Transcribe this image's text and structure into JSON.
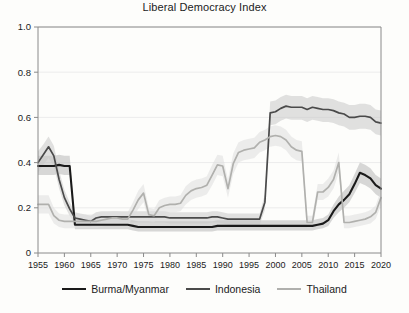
{
  "chart_data": {
    "type": "line",
    "title": "Liberal Democracy Index",
    "xlabel": "",
    "ylabel": "",
    "xlim": [
      1955,
      2020
    ],
    "ylim": [
      0,
      1.0
    ],
    "grid": true,
    "legend_position": "bottom",
    "yticks": [
      "0",
      "0.2",
      "0.4",
      "0.6",
      "0.8",
      "1.0"
    ],
    "ytick_values": [
      0,
      0.2,
      0.4,
      0.6,
      0.8,
      1.0
    ],
    "xticks": [
      "1955",
      "1960",
      "1965",
      "1970",
      "1975",
      "1980",
      "1985",
      "1990",
      "1995",
      "2000",
      "2005",
      "2010",
      "2015",
      "2020"
    ],
    "xtick_values": [
      1955,
      1960,
      1965,
      1970,
      1975,
      1980,
      1985,
      1990,
      1995,
      2000,
      2005,
      2010,
      2015,
      2020
    ],
    "x": [
      1955,
      1956,
      1957,
      1958,
      1959,
      1960,
      1961,
      1962,
      1963,
      1964,
      1965,
      1966,
      1967,
      1968,
      1969,
      1970,
      1971,
      1972,
      1973,
      1974,
      1975,
      1976,
      1977,
      1978,
      1979,
      1980,
      1981,
      1982,
      1983,
      1984,
      1985,
      1986,
      1987,
      1988,
      1989,
      1990,
      1991,
      1992,
      1993,
      1994,
      1995,
      1996,
      1997,
      1998,
      1999,
      2000,
      2001,
      2002,
      2003,
      2004,
      2005,
      2006,
      2007,
      2008,
      2009,
      2010,
      2011,
      2012,
      2013,
      2014,
      2015,
      2016,
      2017,
      2018,
      2019,
      2020
    ],
    "series": [
      {
        "name": "Burma/Myanmar",
        "color": "#1a1a1a",
        "band_color": "#b8b8b8",
        "values": [
          0.385,
          0.385,
          0.385,
          0.385,
          0.39,
          0.385,
          0.385,
          0.125,
          0.125,
          0.125,
          0.125,
          0.125,
          0.125,
          0.125,
          0.125,
          0.125,
          0.125,
          0.125,
          0.12,
          0.115,
          0.115,
          0.115,
          0.115,
          0.115,
          0.115,
          0.115,
          0.115,
          0.115,
          0.115,
          0.115,
          0.115,
          0.115,
          0.115,
          0.115,
          0.12,
          0.12,
          0.12,
          0.12,
          0.12,
          0.12,
          0.12,
          0.12,
          0.12,
          0.12,
          0.12,
          0.12,
          0.12,
          0.12,
          0.12,
          0.12,
          0.12,
          0.12,
          0.12,
          0.125,
          0.13,
          0.145,
          0.185,
          0.215,
          0.235,
          0.26,
          0.305,
          0.355,
          0.345,
          0.33,
          0.3,
          0.285
        ],
        "band_lo": [
          0.345,
          0.345,
          0.345,
          0.345,
          0.35,
          0.345,
          0.345,
          0.105,
          0.105,
          0.105,
          0.105,
          0.105,
          0.105,
          0.105,
          0.105,
          0.105,
          0.105,
          0.105,
          0.1,
          0.095,
          0.095,
          0.095,
          0.095,
          0.095,
          0.095,
          0.095,
          0.095,
          0.095,
          0.095,
          0.095,
          0.095,
          0.095,
          0.095,
          0.095,
          0.1,
          0.1,
          0.1,
          0.1,
          0.1,
          0.1,
          0.1,
          0.1,
          0.1,
          0.1,
          0.1,
          0.1,
          0.1,
          0.1,
          0.1,
          0.1,
          0.1,
          0.1,
          0.1,
          0.105,
          0.11,
          0.12,
          0.155,
          0.18,
          0.2,
          0.225,
          0.265,
          0.31,
          0.3,
          0.285,
          0.26,
          0.245
        ],
        "band_hi": [
          0.43,
          0.43,
          0.43,
          0.43,
          0.435,
          0.43,
          0.43,
          0.15,
          0.15,
          0.15,
          0.15,
          0.15,
          0.15,
          0.15,
          0.15,
          0.15,
          0.15,
          0.15,
          0.145,
          0.14,
          0.14,
          0.14,
          0.14,
          0.14,
          0.14,
          0.14,
          0.14,
          0.14,
          0.14,
          0.14,
          0.14,
          0.14,
          0.14,
          0.14,
          0.145,
          0.145,
          0.145,
          0.145,
          0.145,
          0.145,
          0.145,
          0.145,
          0.145,
          0.145,
          0.145,
          0.145,
          0.145,
          0.145,
          0.145,
          0.145,
          0.145,
          0.145,
          0.145,
          0.15,
          0.155,
          0.17,
          0.215,
          0.25,
          0.275,
          0.3,
          0.35,
          0.4,
          0.39,
          0.375,
          0.345,
          0.33
        ]
      },
      {
        "name": "Indonesia",
        "color": "#4a4a4a",
        "band_color": "#c9c9c9",
        "values": [
          0.4,
          0.435,
          0.47,
          0.43,
          0.325,
          0.245,
          0.195,
          0.155,
          0.15,
          0.145,
          0.14,
          0.155,
          0.16,
          0.16,
          0.16,
          0.16,
          0.16,
          0.16,
          0.16,
          0.16,
          0.16,
          0.16,
          0.16,
          0.16,
          0.16,
          0.155,
          0.155,
          0.155,
          0.155,
          0.155,
          0.155,
          0.155,
          0.155,
          0.16,
          0.16,
          0.155,
          0.15,
          0.15,
          0.15,
          0.15,
          0.15,
          0.15,
          0.15,
          0.225,
          0.62,
          0.625,
          0.64,
          0.65,
          0.645,
          0.645,
          0.645,
          0.635,
          0.645,
          0.64,
          0.635,
          0.635,
          0.63,
          0.62,
          0.615,
          0.6,
          0.6,
          0.605,
          0.605,
          0.6,
          0.58,
          0.575
        ],
        "band_lo": [
          0.355,
          0.39,
          0.42,
          0.385,
          0.285,
          0.21,
          0.165,
          0.13,
          0.125,
          0.12,
          0.115,
          0.13,
          0.135,
          0.135,
          0.135,
          0.135,
          0.135,
          0.135,
          0.135,
          0.135,
          0.135,
          0.135,
          0.135,
          0.135,
          0.135,
          0.13,
          0.13,
          0.13,
          0.13,
          0.13,
          0.13,
          0.13,
          0.13,
          0.135,
          0.135,
          0.13,
          0.125,
          0.125,
          0.125,
          0.125,
          0.125,
          0.125,
          0.125,
          0.19,
          0.565,
          0.57,
          0.585,
          0.595,
          0.59,
          0.59,
          0.59,
          0.58,
          0.59,
          0.585,
          0.58,
          0.58,
          0.575,
          0.565,
          0.56,
          0.545,
          0.545,
          0.55,
          0.55,
          0.545,
          0.525,
          0.52
        ],
        "band_hi": [
          0.45,
          0.48,
          0.515,
          0.475,
          0.365,
          0.28,
          0.225,
          0.18,
          0.175,
          0.17,
          0.165,
          0.18,
          0.185,
          0.185,
          0.185,
          0.185,
          0.185,
          0.185,
          0.185,
          0.185,
          0.185,
          0.185,
          0.185,
          0.185,
          0.185,
          0.18,
          0.18,
          0.18,
          0.18,
          0.18,
          0.18,
          0.18,
          0.18,
          0.185,
          0.185,
          0.18,
          0.175,
          0.175,
          0.175,
          0.175,
          0.175,
          0.175,
          0.175,
          0.26,
          0.67,
          0.675,
          0.69,
          0.7,
          0.695,
          0.695,
          0.695,
          0.685,
          0.695,
          0.69,
          0.685,
          0.685,
          0.68,
          0.67,
          0.665,
          0.655,
          0.655,
          0.66,
          0.66,
          0.655,
          0.635,
          0.63
        ]
      },
      {
        "name": "Thailand",
        "color": "#b0b0ad",
        "band_color": "#dedede",
        "values": [
          0.215,
          0.215,
          0.215,
          0.165,
          0.145,
          0.14,
          0.14,
          0.14,
          0.14,
          0.14,
          0.14,
          0.14,
          0.145,
          0.15,
          0.155,
          0.155,
          0.15,
          0.15,
          0.19,
          0.235,
          0.265,
          0.17,
          0.165,
          0.2,
          0.21,
          0.215,
          0.215,
          0.22,
          0.255,
          0.275,
          0.285,
          0.29,
          0.3,
          0.345,
          0.39,
          0.385,
          0.285,
          0.395,
          0.445,
          0.455,
          0.46,
          0.465,
          0.49,
          0.5,
          0.515,
          0.52,
          0.515,
          0.5,
          0.47,
          0.455,
          0.45,
          0.135,
          0.135,
          0.27,
          0.27,
          0.29,
          0.325,
          0.4,
          0.135,
          0.135,
          0.14,
          0.145,
          0.15,
          0.16,
          0.18,
          0.245
        ],
        "band_lo": [
          0.175,
          0.175,
          0.175,
          0.13,
          0.115,
          0.11,
          0.11,
          0.11,
          0.11,
          0.11,
          0.11,
          0.11,
          0.115,
          0.12,
          0.125,
          0.125,
          0.12,
          0.12,
          0.155,
          0.195,
          0.225,
          0.14,
          0.135,
          0.165,
          0.175,
          0.18,
          0.18,
          0.185,
          0.215,
          0.235,
          0.245,
          0.25,
          0.26,
          0.3,
          0.345,
          0.34,
          0.245,
          0.35,
          0.4,
          0.41,
          0.415,
          0.42,
          0.445,
          0.455,
          0.47,
          0.475,
          0.47,
          0.455,
          0.425,
          0.41,
          0.405,
          0.11,
          0.11,
          0.235,
          0.235,
          0.25,
          0.285,
          0.355,
          0.11,
          0.11,
          0.115,
          0.12,
          0.125,
          0.13,
          0.15,
          0.21
        ],
        "band_hi": [
          0.255,
          0.255,
          0.255,
          0.2,
          0.175,
          0.17,
          0.17,
          0.17,
          0.17,
          0.17,
          0.17,
          0.17,
          0.175,
          0.18,
          0.185,
          0.185,
          0.18,
          0.18,
          0.225,
          0.275,
          0.305,
          0.2,
          0.195,
          0.235,
          0.245,
          0.25,
          0.25,
          0.255,
          0.295,
          0.315,
          0.325,
          0.33,
          0.34,
          0.39,
          0.435,
          0.43,
          0.325,
          0.44,
          0.49,
          0.5,
          0.505,
          0.51,
          0.535,
          0.545,
          0.56,
          0.565,
          0.56,
          0.545,
          0.515,
          0.5,
          0.495,
          0.165,
          0.165,
          0.305,
          0.305,
          0.33,
          0.365,
          0.445,
          0.165,
          0.165,
          0.17,
          0.175,
          0.18,
          0.19,
          0.21,
          0.28
        ]
      }
    ]
  },
  "legend": [
    {
      "label": "Burma/Myanmar",
      "color": "#1a1a1a"
    },
    {
      "label": "Indonesia",
      "color": "#4a4a4a"
    },
    {
      "label": "Thailand",
      "color": "#b0b0ad"
    }
  ],
  "axis": {
    "frame_color": "#8a8a8a",
    "grid_color": "#ececec"
  }
}
